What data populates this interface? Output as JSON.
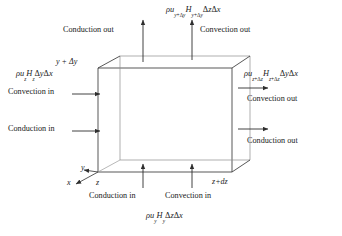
{
  "diagram": {
    "cube": {
      "label_top_left_corner": "y + Δy",
      "label_origin_z": "z",
      "label_far_z": "z+dz"
    },
    "axes": [
      {
        "name": "x-axis-label",
        "text": "x"
      },
      {
        "name": "y-axis-label",
        "text": "y"
      }
    ],
    "top": {
      "conduction_out": "Conduction out",
      "convection_out": "Convection out",
      "convection_formula": "ρuᵧ₊ΔᵧHᵧ₊ΔᵧΔzΔx"
    },
    "left": {
      "convection_in": "Convection in",
      "conduction_in": "Conduction in",
      "corner_label": "y + Δy",
      "convection_formula": "ρu₂H₂ΔyΔx"
    },
    "right": {
      "convection_out": "Convection out",
      "conduction_out": "Conduction out",
      "convection_formula": "ρu₂₊Δ₂H₂₊Δ₂ΔyΔx"
    },
    "bottom": {
      "conduction_in": "Conduction in",
      "convection_in": "Convection in",
      "convection_formula": "ρuᵧHᵧΔzΔx",
      "left_z": "z",
      "right_z": "z+dz"
    },
    "colors": {
      "line": "#3a3a3a",
      "hidden_line": "#9a9a9a",
      "text": "#222222",
      "background": "#ffffff"
    }
  }
}
